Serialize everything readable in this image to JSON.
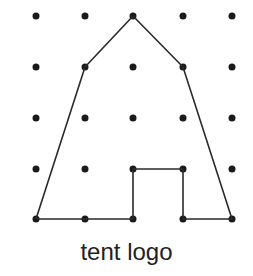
{
  "caption": "tent logo",
  "grid": {
    "columns": 5,
    "rows": 5,
    "x": [
      36,
      85,
      133,
      183,
      232
    ],
    "y": [
      16,
      67,
      118,
      169,
      219
    ],
    "dot_radius": 3.5,
    "dot_color": "#1a1a1a"
  },
  "shape": {
    "name": "tent",
    "stroke_color": "#2a2a2a",
    "stroke_width": 1.6,
    "points_grid": [
      [
        0,
        4
      ],
      [
        1,
        4
      ],
      [
        2,
        4
      ],
      [
        2,
        3
      ],
      [
        3,
        3
      ],
      [
        3,
        4
      ],
      [
        4,
        4
      ],
      [
        3,
        1
      ],
      [
        2,
        0
      ],
      [
        1,
        1
      ],
      [
        0,
        4
      ]
    ]
  }
}
